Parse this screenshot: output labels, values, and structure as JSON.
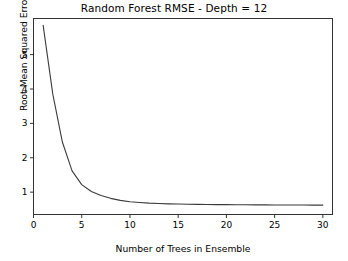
{
  "chart_data": {
    "type": "line",
    "title": "Random Forest RMSE - Depth = 12",
    "xlabel": "Number of Trees in Ensemble",
    "ylabel": "Root Mean Squared Error",
    "xlim": [
      0,
      31
    ],
    "ylim": [
      0.35,
      6.05
    ],
    "xticks": [
      0,
      5,
      10,
      15,
      20,
      25,
      30
    ],
    "xtick_labels": [
      "0",
      "5",
      "10",
      "15",
      "20",
      "25",
      "30"
    ],
    "yticks": [
      1,
      2,
      3,
      4,
      5
    ],
    "ytick_labels": [
      "1",
      "2",
      "3",
      "4",
      "5"
    ],
    "grid": false,
    "legend": null,
    "line_color": "#3b3b3b",
    "line_width": 1.0,
    "x": [
      1,
      2,
      3,
      4,
      5,
      6,
      7,
      8,
      9,
      10,
      11,
      12,
      13,
      14,
      15,
      16,
      17,
      18,
      19,
      20,
      21,
      22,
      23,
      24,
      25,
      26,
      27,
      28,
      29,
      30
    ],
    "values": [
      5.85,
      3.85,
      2.45,
      1.62,
      1.22,
      1.02,
      0.9,
      0.82,
      0.76,
      0.72,
      0.7,
      0.68,
      0.67,
      0.66,
      0.655,
      0.65,
      0.645,
      0.64,
      0.638,
      0.636,
      0.634,
      0.632,
      0.63,
      0.629,
      0.628,
      0.627,
      0.626,
      0.625,
      0.624,
      0.623
    ],
    "series": [
      {
        "name": "RMSE",
        "values": [
          5.85,
          3.85,
          2.45,
          1.62,
          1.22,
          1.02,
          0.9,
          0.82,
          0.76,
          0.72,
          0.7,
          0.68,
          0.67,
          0.66,
          0.655,
          0.65,
          0.645,
          0.64,
          0.638,
          0.636,
          0.634,
          0.632,
          0.63,
          0.629,
          0.628,
          0.627,
          0.626,
          0.625,
          0.624,
          0.623
        ]
      }
    ]
  },
  "figure": {
    "background_color": "#ffffff",
    "axes_color": "#333333"
  }
}
